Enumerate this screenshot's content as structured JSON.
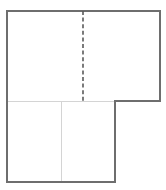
{
  "figure": {
    "background_color": "#ffffff",
    "outline_color": "#6e6e6e",
    "interior_divider_color": "#d4d4d4",
    "dashed_line_color": "#5a5a5a",
    "outline_width": 1.4,
    "interior_width": 1,
    "dash_pattern": "4 2.6",
    "dash_width": 1.6,
    "canvas": {
      "width": 166,
      "height": 190
    },
    "geometry": {
      "left_x": 7,
      "right_x": 160,
      "top_y": 11,
      "step_y": 101,
      "bottom_y": 182,
      "lower_right_x": 115,
      "symmetry_x": 83,
      "lower_divider_x": 61
    },
    "outline_path": "M 7 11 L 160 11 L 160 101 L 115 101 L 115 182 L 7 182 Z",
    "parts": [
      {
        "name": "upper-rectangle",
        "x": 7,
        "y": 11,
        "width": 153,
        "height": 90
      },
      {
        "name": "lower-rectangle",
        "x": 7,
        "y": 101,
        "width": 108,
        "height": 81
      }
    ],
    "interior_lines": [
      {
        "name": "horizontal-step-divider",
        "x1": 7,
        "y1": 101,
        "x2": 115,
        "y2": 101
      },
      {
        "name": "vertical-lower-divider",
        "x1": 61,
        "y1": 101,
        "x2": 61,
        "y2": 182
      }
    ],
    "dashed_lines": [
      {
        "name": "line-of-symmetry",
        "x1": 83,
        "y1": 11,
        "x2": 83,
        "y2": 101
      }
    ]
  }
}
